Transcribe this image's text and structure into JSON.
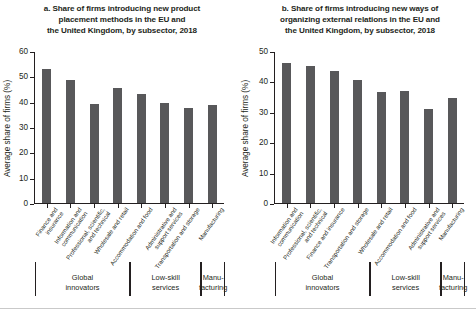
{
  "figure": {
    "panels": [
      {
        "key": "a",
        "title_lines": [
          "a. Share of firms introducing new product",
          "placement methods in the EU and",
          "the United Kingdom, by subsector, 2018"
        ],
        "ylabel": "Average share of firms (%)",
        "yticks": [
          "0",
          "10",
          "20",
          "30",
          "40",
          "50",
          "60"
        ],
        "groups": [
          {
            "label_lines": [
              "Global",
              "innovators"
            ],
            "span": 4
          },
          {
            "label_lines": [
              "Low-skill",
              "services"
            ],
            "span": 3
          },
          {
            "label_lines": [
              "Manu-",
              "facturing"
            ],
            "span": 1
          }
        ]
      },
      {
        "key": "b",
        "title_lines": [
          "b. Share of firms introducing new ways of",
          "organizing external relations in the EU and",
          "the United Kingdom, by subsector, 2018"
        ],
        "ylabel": "Average share of firms (%)",
        "yticks": [
          "0",
          "10",
          "20",
          "30",
          "40",
          "50"
        ],
        "groups": [
          {
            "label_lines": [
              "Global",
              "innovators"
            ],
            "span": 4
          },
          {
            "label_lines": [
              "Low-skill",
              "services"
            ],
            "span": 3
          },
          {
            "label_lines": [
              "Manu-",
              "facturing"
            ],
            "span": 1
          }
        ]
      }
    ]
  },
  "chart_data": [
    {
      "type": "bar",
      "panel": "a",
      "title": "a. Share of firms introducing new product placement methods in the EU and the United Kingdom, by subsector, 2018",
      "xlabel": "",
      "ylabel": "Average share of firms (%)",
      "ylim": [
        0,
        60
      ],
      "yticks": [
        0,
        10,
        20,
        30,
        40,
        50,
        60
      ],
      "grid": false,
      "legend": "none",
      "bar_color": "#58585a",
      "categories": [
        "Finance and insurance",
        "Information and communication",
        "Professional, scientific, and technical",
        "Wholesale and retail",
        "Accommodation and food",
        "Administrative and support services",
        "Transportation and storage",
        "Manufacturing"
      ],
      "category_lines": [
        [
          "Finance and",
          "insurance"
        ],
        [
          "Information and",
          "communication"
        ],
        [
          "Professional, scientific,",
          "and technical"
        ],
        [
          "Wholesale and retail"
        ],
        [
          "Accommodation and food"
        ],
        [
          "Administrative and",
          "support services"
        ],
        [
          "Transportation and storage"
        ],
        [
          "Manufacturing"
        ]
      ],
      "values": [
        53,
        48.5,
        39,
        45.5,
        43,
        39.5,
        37.5,
        38.5
      ],
      "group_brackets": [
        {
          "label": "Global innovators",
          "categories": 4
        },
        {
          "label": "Low-skill services",
          "categories": 3
        },
        {
          "label": "Manufacturing",
          "categories": 1
        }
      ]
    },
    {
      "type": "bar",
      "panel": "b",
      "title": "b. Share of firms introducing new ways of organizing external relations in the EU and the United Kingdom, by subsector, 2018",
      "xlabel": "",
      "ylabel": "Average share of firms (%)",
      "ylim": [
        0,
        50
      ],
      "yticks": [
        0,
        10,
        20,
        30,
        40,
        50
      ],
      "grid": false,
      "legend": "none",
      "bar_color": "#58585a",
      "categories": [
        "Information and communication",
        "Professional, scientific, and technical",
        "Finance and insurance",
        "Transportation and storage",
        "Wholesale and retail",
        "Accommodation and food",
        "Administrative and support services",
        "Manufacturing"
      ],
      "category_lines": [
        [
          "Information and",
          "communication"
        ],
        [
          "Professional, scientific,",
          "and technical"
        ],
        [
          "Finance and insurance"
        ],
        [
          "Transportation and storage"
        ],
        [
          "Wholesale and retail"
        ],
        [
          "Accommodation and food"
        ],
        [
          "Administrative and",
          "support services"
        ],
        [
          "Manufacturing"
        ]
      ],
      "values": [
        46,
        45,
        43.5,
        40.5,
        36.5,
        37,
        31,
        34.5
      ],
      "group_brackets": [
        {
          "label": "Global innovators",
          "categories": 4
        },
        {
          "label": "Low-skill services",
          "categories": 3
        },
        {
          "label": "Manufacturing",
          "categories": 1
        }
      ]
    }
  ]
}
